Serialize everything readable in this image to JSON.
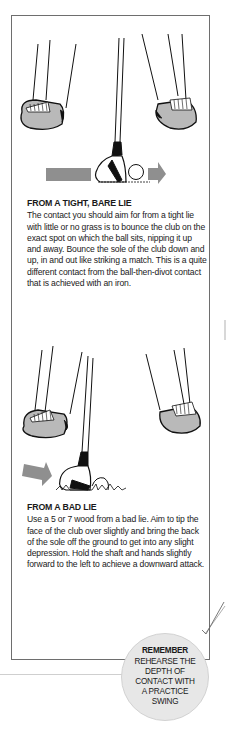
{
  "sections": [
    {
      "heading": "FROM A TIGHT, BARE LIE",
      "body": "The contact you should aim for from a tight lie with little or no grass is to bounce the club on the exact spot on which the ball sits, nipping it up and away. Bounce the sole of the club down and up, in and out like striking a match. This is a quite different contact from the ball-then-divot contact that is achieved with an iron."
    },
    {
      "heading": "FROM A BAD LIE",
      "body": "Use a 5 or 7 wood from a bad lie. Aim to tip the face of the club over slightly and bring the back of the sole off the ground to get into any slight depression. Hold the shaft and hands slightly forward to the left to achieve a downward attack."
    }
  ],
  "callout": {
    "title": "REMEMBER",
    "lines": [
      "REHEARSE THE",
      "DEPTH OF",
      "CONTACT WITH",
      "A PRACTICE",
      "SWING"
    ]
  },
  "colors": {
    "arrow": "#8f8f8f",
    "shoe": "#b9b9b9",
    "callout_fill": "#e7e7e7",
    "frame": "#6e6e6e"
  }
}
